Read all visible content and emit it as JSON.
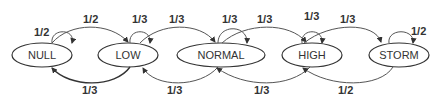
{
  "diagram": {
    "type": "state-transition",
    "states": [
      {
        "id": "null",
        "label": "NULL",
        "cx": 42,
        "cy": 55,
        "rx": 30,
        "ry": 12
      },
      {
        "id": "low",
        "label": "LOW",
        "cx": 128,
        "cy": 55,
        "rx": 30,
        "ry": 12
      },
      {
        "id": "normal",
        "label": "NORMAL",
        "cx": 221,
        "cy": 55,
        "rx": 44,
        "ry": 12
      },
      {
        "id": "high",
        "label": "HIGH",
        "cx": 312,
        "cy": 55,
        "rx": 30,
        "ry": 12
      },
      {
        "id": "storm",
        "label": "STORM",
        "cx": 399,
        "cy": 55,
        "rx": 30,
        "ry": 12
      }
    ],
    "edges": [
      {
        "from": "null",
        "to": "null",
        "label": "1/2"
      },
      {
        "from": "null",
        "to": "low",
        "label": "1/2"
      },
      {
        "from": "low",
        "to": "low",
        "label": "1/3"
      },
      {
        "from": "low",
        "to": "normal",
        "label": "1/3"
      },
      {
        "from": "low",
        "to": "null",
        "label": "1/3"
      },
      {
        "from": "normal",
        "to": "normal",
        "label": "1/3"
      },
      {
        "from": "normal",
        "to": "high",
        "label": "1/3"
      },
      {
        "from": "normal",
        "to": "low",
        "label": "1/3"
      },
      {
        "from": "high",
        "to": "high",
        "label": "1/3"
      },
      {
        "from": "high",
        "to": "storm",
        "label": "1/3"
      },
      {
        "from": "high",
        "to": "normal",
        "label": "1/3"
      },
      {
        "from": "storm",
        "to": "storm",
        "label": "1/2"
      },
      {
        "from": "storm",
        "to": "high",
        "label": "1/2"
      }
    ]
  },
  "labels": {
    "null_state": "NULL",
    "low_state": "LOW",
    "normal_state": "NORMAL",
    "high_state": "HIGH",
    "storm_state": "STORM",
    "null_self": "1/2",
    "null_to_low": "1/2",
    "low_self": "1/3",
    "low_to_normal": "1/3",
    "low_to_null": "1/3",
    "normal_self": "1/3",
    "normal_to_high": "1/3",
    "normal_to_low": "1/3",
    "high_self": "1/3",
    "high_to_storm": "1/3",
    "high_to_normal": "1/3",
    "storm_self": "1/2",
    "storm_to_high": "1/2"
  }
}
